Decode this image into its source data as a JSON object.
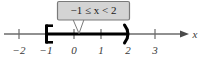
{
  "figure": {
    "type": "number-line-interval-diagram",
    "axis_variable": "x",
    "callout": {
      "text": "−1 ≤ x < 2",
      "parts": {
        "lower_bound": "−1",
        "lower_relation": "≤",
        "variable": "x",
        "upper_relation": "<",
        "upper_bound": "2"
      },
      "fill_color": "#d4d4d4",
      "border_color": "#7a7a7a",
      "text_color": "#1a1a1a"
    },
    "ticks": [
      {
        "value": -2,
        "label": "−2",
        "x": 19
      },
      {
        "value": -1,
        "label": "−1",
        "x": 46
      },
      {
        "value": 0,
        "label": "0",
        "x": 74
      },
      {
        "value": 1,
        "label": "1",
        "x": 101
      },
      {
        "value": 2,
        "label": "2",
        "x": 128
      },
      {
        "value": 3,
        "label": "3",
        "x": 155
      }
    ],
    "interval": {
      "from": -1,
      "to": 2,
      "left_endpoint": "closed",
      "right_endpoint": "open",
      "left_bracket_glyph": "[",
      "right_bracket_glyph": ")",
      "bar_color": "#000000"
    },
    "axis": {
      "line_color": "#6b6b6b",
      "arrow_direction": "right",
      "y": 34
    }
  }
}
